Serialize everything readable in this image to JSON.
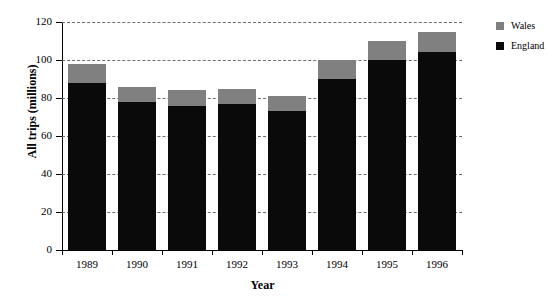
{
  "chart_data": {
    "type": "bar",
    "subtype": "stacked-vertical",
    "title": "",
    "xlabel": "Year",
    "ylabel": "All trips (millions)",
    "categories": [
      "1989",
      "1990",
      "1991",
      "1992",
      "1993",
      "1994",
      "1995",
      "1996"
    ],
    "series": [
      {
        "name": "England",
        "color": "#0a0a0a",
        "values": [
          88,
          78,
          76,
          77,
          73,
          90,
          100,
          104
        ]
      },
      {
        "name": "Wales",
        "color": "#808080",
        "values": [
          10,
          8,
          8,
          8,
          8,
          10,
          10,
          11
        ]
      }
    ],
    "totals": [
      98,
      86,
      84,
      85,
      81,
      100,
      110,
      115
    ],
    "ylim": [
      0,
      120
    ],
    "yticks": [
      0,
      20,
      40,
      60,
      80,
      100,
      120
    ],
    "ytick_labels": [
      "0",
      "20",
      "40",
      "60",
      "80",
      "100",
      "120"
    ],
    "grid": true,
    "grid_style": "dashed",
    "grid_axis": "y",
    "legend_position": "top-right",
    "legend_entries": [
      "Wales",
      "England"
    ]
  },
  "colors": {
    "england": "#0a0a0a",
    "wales": "#808080",
    "gridline": "#6e6e6e",
    "axis": "#000000",
    "background": "#ffffff"
  }
}
